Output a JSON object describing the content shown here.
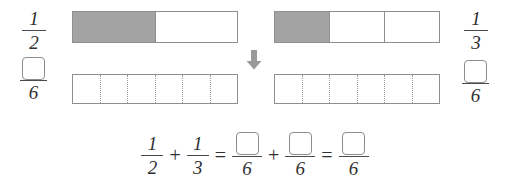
{
  "diagram": {
    "type": "fraction-bar-model",
    "topic": "Adding fractions with unlike denominators using bar models",
    "colors": {
      "shaded_fill": "#a3a3a3",
      "bar_border": "#8f8f8f",
      "divider": "#9a9a9a",
      "text": "#2f2f2f",
      "arrow": "#9a9a9a",
      "background": "#ffffff"
    }
  },
  "left_group": {
    "top_label": {
      "numerator": "1",
      "denominator": "2"
    },
    "bottom_label": {
      "numerator": "",
      "denominator": "6",
      "numerator_is_empty_box": true
    },
    "top_bar": {
      "total_parts": 2,
      "shaded_parts": 1,
      "divider_style": "solid"
    },
    "bottom_bar": {
      "total_parts": 6,
      "shaded_parts": 0,
      "divider_style": "dotted"
    }
  },
  "right_group": {
    "top_label": {
      "numerator": "1",
      "denominator": "3"
    },
    "bottom_label": {
      "numerator": "",
      "denominator": "6",
      "numerator_is_empty_box": true
    },
    "top_bar": {
      "total_parts": 3,
      "shaded_parts": 1,
      "divider_style": "dotted"
    },
    "bottom_bar": {
      "total_parts": 6,
      "shaded_parts": 0,
      "divider_style": "dotted"
    }
  },
  "arrow": {
    "direction": "down",
    "icon": "arrow-down-icon"
  },
  "equation": {
    "terms": [
      {
        "kind": "fraction",
        "numerator": "1",
        "denominator": "2"
      },
      {
        "kind": "operator",
        "symbol": "+"
      },
      {
        "kind": "fraction",
        "numerator": "1",
        "denominator": "3"
      },
      {
        "kind": "operator",
        "symbol": "="
      },
      {
        "kind": "fraction",
        "numerator": "",
        "denominator": "6",
        "numerator_is_empty_box": true
      },
      {
        "kind": "operator",
        "symbol": "+"
      },
      {
        "kind": "fraction",
        "numerator": "",
        "denominator": "6",
        "numerator_is_empty_box": true
      },
      {
        "kind": "operator",
        "symbol": "="
      },
      {
        "kind": "fraction",
        "numerator": "",
        "denominator": "6",
        "numerator_is_empty_box": true
      }
    ],
    "plain_text": "1/2 + 1/3 = ?/6 + ?/6 = ?/6"
  }
}
